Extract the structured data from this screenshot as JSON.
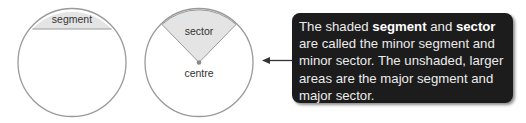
{
  "diagram": {
    "segment_circle": {
      "label": "segment",
      "shade_color": "#e4e4e4",
      "stroke_color": "#9a9a9a"
    },
    "sector_circle": {
      "label": "sector",
      "centre_label": "centre",
      "shade_color": "#e4e4e4",
      "stroke_color": "#9a9a9a"
    },
    "callout": {
      "line1_pre": "The shaded ",
      "bold1": "segment",
      "line1_mid": " and ",
      "bold2": "sector",
      "rest": " are called the minor segment and minor sector. The unshaded, larger areas are the major segment and major sector.",
      "background": "#1c1c1c",
      "text_color": "#ececec"
    },
    "arrow": {
      "direction": "left"
    }
  }
}
